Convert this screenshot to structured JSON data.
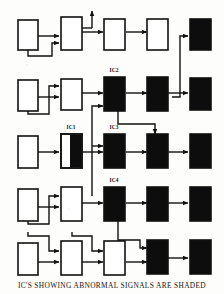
{
  "figure": {
    "kind": "block-diagram",
    "caption": "IC'S SHOWING ABNORMAL SIGNALS ARE SHADED",
    "legend_meaning": "shaded (black) blocks are ICs showing abnormal signals",
    "colors": {
      "normal_block_fill": "#ffffff",
      "abnormal_block_fill": "#0d0d0d",
      "outline": "#111111",
      "wire": "#111111",
      "background": "#fdfdfb"
    },
    "grid": {
      "rows": 5,
      "columns": 5
    }
  },
  "labels": {
    "ic1": "IC1",
    "ic2": "IC2",
    "ic3": "IC3",
    "ic4": "IC4"
  },
  "blocks": [
    {
      "id": "r1c1",
      "row": 1,
      "col": 1,
      "state": "normal",
      "label": ""
    },
    {
      "id": "r1c2",
      "row": 1,
      "col": 2,
      "state": "normal",
      "label": ""
    },
    {
      "id": "r1c3",
      "row": 1,
      "col": 3,
      "state": "normal",
      "label": ""
    },
    {
      "id": "r1c4",
      "row": 1,
      "col": 4,
      "state": "normal",
      "label": ""
    },
    {
      "id": "r1c5",
      "row": 1,
      "col": 5,
      "state": "abnormal",
      "label": ""
    },
    {
      "id": "r2c1",
      "row": 2,
      "col": 1,
      "state": "normal",
      "label": ""
    },
    {
      "id": "r2c2",
      "row": 2,
      "col": 2,
      "state": "normal",
      "label": ""
    },
    {
      "id": "r2c3",
      "row": 2,
      "col": 3,
      "state": "abnormal",
      "label": "IC2"
    },
    {
      "id": "r2c4",
      "row": 2,
      "col": 4,
      "state": "abnormal",
      "label": ""
    },
    {
      "id": "r2c5",
      "row": 2,
      "col": 5,
      "state": "abnormal",
      "label": ""
    },
    {
      "id": "r3c1",
      "row": 3,
      "col": 1,
      "state": "normal",
      "label": ""
    },
    {
      "id": "r3c2",
      "row": 3,
      "col": 2,
      "state": "partial",
      "label": "IC1"
    },
    {
      "id": "r3c3",
      "row": 3,
      "col": 3,
      "state": "abnormal",
      "label": "IC3"
    },
    {
      "id": "r3c4",
      "row": 3,
      "col": 4,
      "state": "abnormal",
      "label": ""
    },
    {
      "id": "r3c5",
      "row": 3,
      "col": 5,
      "state": "abnormal",
      "label": ""
    },
    {
      "id": "r4c1",
      "row": 4,
      "col": 1,
      "state": "normal",
      "label": ""
    },
    {
      "id": "r4c2",
      "row": 4,
      "col": 2,
      "state": "normal",
      "label": ""
    },
    {
      "id": "r4c3",
      "row": 4,
      "col": 3,
      "state": "abnormal",
      "label": "IC4"
    },
    {
      "id": "r4c4",
      "row": 4,
      "col": 4,
      "state": "abnormal",
      "label": ""
    },
    {
      "id": "r4c5",
      "row": 4,
      "col": 5,
      "state": "abnormal",
      "label": ""
    },
    {
      "id": "r5c1",
      "row": 5,
      "col": 1,
      "state": "normal",
      "label": ""
    },
    {
      "id": "r5c2",
      "row": 5,
      "col": 2,
      "state": "normal",
      "label": ""
    },
    {
      "id": "r5c3",
      "row": 5,
      "col": 3,
      "state": "normal",
      "label": ""
    },
    {
      "id": "r5c4",
      "row": 5,
      "col": 4,
      "state": "abnormal",
      "label": ""
    },
    {
      "id": "r5c5",
      "row": 5,
      "col": 5,
      "state": "abnormal",
      "label": ""
    }
  ],
  "connections": {
    "row_chains": [
      "r1c1 -> r1c2 -> r1c3 -> r1c4",
      "r2c1 -> r2c2 -> r2c3 -> r2c4 -> r2c5",
      "r3c1 -> r3c2 -> r3c3 -> r3c4 -> r3c5",
      "r4c1 -> r4c2 -> r4c3 -> r4c4 -> r4c5",
      "r5c1 -> r5c2 -> r5c3 -> r5c4 -> r5c5"
    ],
    "feedback_paths": [
      "r1c1 bottom -> up into r1c2 left",
      "r1c2 top -> output arrow up (off diagram)",
      "r2c1 bottom -> up into r2c2 left",
      "r2c5 left -> up into r1c5 left",
      "r2c3 bottom -> down-right into r3c4 top",
      "r3c3 left <- up from r4 region",
      "r4c1 bottom -> up into r4c2 left",
      "r4c3 bottom -> down-right into r5c4 left",
      "r5c1 bottom -> up into r5c2 left",
      "r5c2 bottom -> up into r5c3 left"
    ]
  }
}
